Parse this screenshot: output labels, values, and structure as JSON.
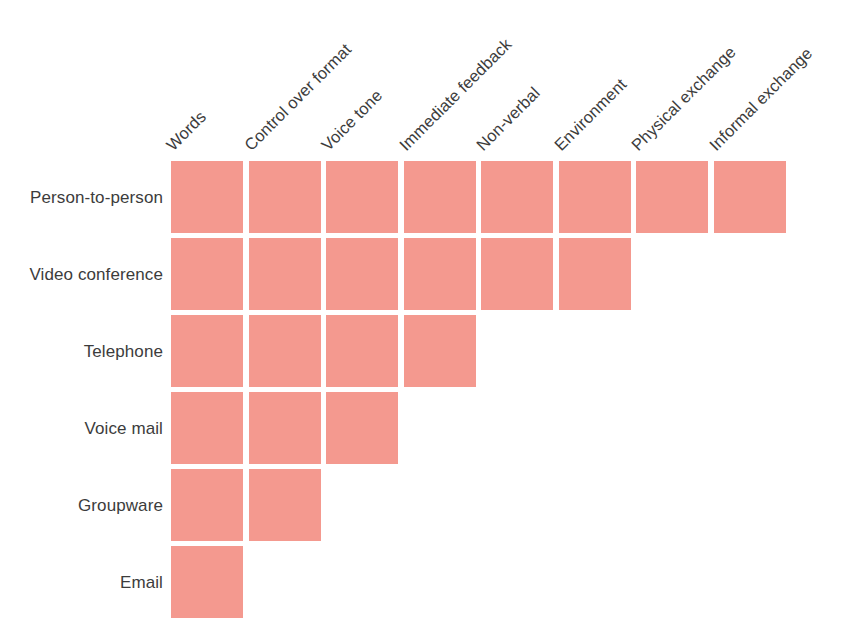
{
  "chart_data": {
    "type": "heatmap",
    "title": "",
    "subtitle": "",
    "xlabel": "",
    "ylabel": "",
    "grid": false,
    "legend": null,
    "orientation": "rows-are-media, columns-are-attributes",
    "cell_color": "#f4998f",
    "text_color": "#3c3c3c",
    "background": "#ffffff",
    "categories": [
      "Words",
      "Control over format",
      "Voice tone",
      "Immediate feedback",
      "Non-verbal",
      "Environment",
      "Physical exchange",
      "Informal exchange"
    ],
    "rows": [
      "Person-to-person",
      "Video conference",
      "Telephone",
      "Voice mail",
      "Groupware",
      "Email"
    ],
    "series": [
      {
        "name": "Person-to-person",
        "values": [
          1,
          1,
          1,
          1,
          1,
          1,
          1,
          1
        ]
      },
      {
        "name": "Video conference",
        "values": [
          1,
          1,
          1,
          1,
          1,
          1,
          0,
          0
        ]
      },
      {
        "name": "Telephone",
        "values": [
          1,
          1,
          1,
          1,
          0,
          0,
          0,
          0
        ]
      },
      {
        "name": "Voice mail",
        "values": [
          1,
          1,
          1,
          0,
          0,
          0,
          0,
          0
        ]
      },
      {
        "name": "Groupware",
        "values": [
          1,
          1,
          0,
          0,
          0,
          0,
          0,
          0
        ]
      },
      {
        "name": "Email",
        "values": [
          1,
          0,
          0,
          0,
          0,
          0,
          0,
          0
        ]
      }
    ],
    "filled_counts": [
      8,
      6,
      4,
      3,
      2,
      1
    ]
  },
  "columns": {
    "headers": [
      {
        "label": "Words"
      },
      {
        "label": "Control over format"
      },
      {
        "label": "Voice tone"
      },
      {
        "label": "Immediate feedback"
      },
      {
        "label": "Non-verbal"
      },
      {
        "label": "Environment"
      },
      {
        "label": "Physical exchange"
      },
      {
        "label": "Informal exchange"
      }
    ]
  },
  "rows": {
    "labels": [
      {
        "label": "Person-to-person",
        "filled": 8
      },
      {
        "label": "Video conference",
        "filled": 6
      },
      {
        "label": "Telephone",
        "filled": 4
      },
      {
        "label": "Voice mail",
        "filled": 3
      },
      {
        "label": "Groupware",
        "filled": 2
      },
      {
        "label": "Email",
        "filled": 1
      }
    ]
  }
}
